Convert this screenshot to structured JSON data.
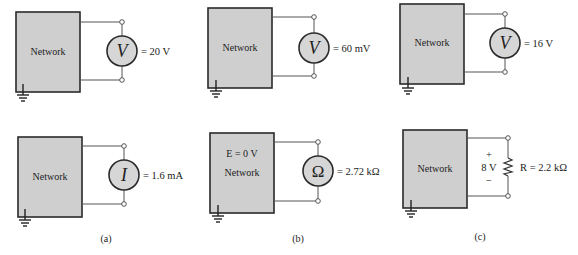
{
  "figure": {
    "panels": [
      {
        "id": "a",
        "caption": "(a)",
        "top": {
          "network_label": "Network",
          "meter_symbol": "V",
          "meter_type": "voltmeter",
          "reading": "= 20 V"
        },
        "bottom": {
          "network_label": "Network",
          "meter_symbol": "I",
          "meter_type": "ammeter",
          "reading": "= 1.6 mA"
        }
      },
      {
        "id": "b",
        "caption": "(b)",
        "top": {
          "network_label": "Network",
          "meter_symbol": "V",
          "meter_type": "voltmeter",
          "reading": "= 60 mV"
        },
        "bottom": {
          "network_label": "Network",
          "source_label": "E = 0 V",
          "meter_symbol": "Ω",
          "meter_type": "ohmmeter",
          "reading": "= 2.72 kΩ"
        }
      },
      {
        "id": "c",
        "caption": "(c)",
        "top": {
          "network_label": "Network",
          "meter_symbol": "V",
          "meter_type": "voltmeter",
          "reading": "= 16 V"
        },
        "bottom": {
          "network_label": "Network",
          "plus": "+",
          "voltage": "8 V",
          "minus": "−",
          "resistor_label": "R = 2.2 kΩ"
        }
      }
    ],
    "colors": {
      "network_fill": "#cfcfcf",
      "meter_fill": "#d6d6d6",
      "line": "#2a2a2a"
    }
  }
}
